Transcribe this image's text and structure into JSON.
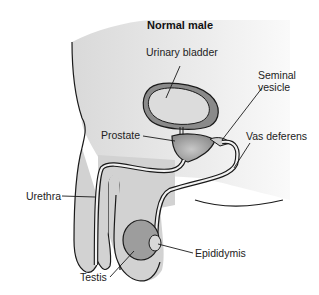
{
  "title": "Normal male",
  "labels": {
    "urinary_bladder": "Urinary bladder",
    "seminal_vesicle_line1": "Seminal",
    "seminal_vesicle_line2": "vesicle",
    "prostate": "Prostate",
    "vas_deferens": "Vas deferens",
    "urethra": "Urethra",
    "epididymis": "Epididymis",
    "testis": "Testis"
  },
  "colors": {
    "outline": "#1a1a1a",
    "body_fill": "#e6e6e6",
    "genital_fill": "#d2d2d2",
    "bladder_wall": "#8a8a8a",
    "bladder_inner": "#dcdcdc",
    "prostate": "#9a9a9a",
    "testis": "#9d9d9d",
    "duct": "#f2f2f2"
  }
}
